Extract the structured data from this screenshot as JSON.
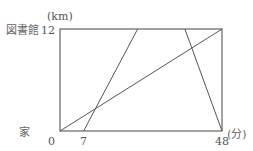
{
  "diagram": {
    "y_unit_label": "(km)",
    "x_unit_label": "(分)",
    "top_place_label": "図書館",
    "bottom_place_label": "家",
    "y_max_label": "12",
    "x_origin_label": "0",
    "x_tick_label_7": "7",
    "x_max_label": "48",
    "x_range": [
      0,
      48
    ],
    "y_range": [
      0,
      12
    ],
    "lines": [
      {
        "name": "line-start-7",
        "points": [
          [
            7,
            0
          ],
          [
            23,
            12
          ]
        ]
      },
      {
        "name": "line-return",
        "points": [
          [
            37,
            12
          ],
          [
            48,
            0
          ]
        ]
      },
      {
        "name": "line-diagonal",
        "points": [
          [
            0,
            0
          ],
          [
            48,
            12
          ]
        ]
      }
    ]
  }
}
